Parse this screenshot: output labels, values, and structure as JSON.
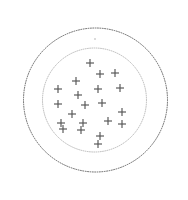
{
  "figure": {
    "title": "",
    "width": 188,
    "height": 200,
    "background_color": "#ffffff"
  },
  "chart_data": {
    "type": "scatter",
    "title": "",
    "subtitle": "",
    "xlabel": "",
    "ylabel": "",
    "xlim": [
      0,
      188
    ],
    "ylim": [
      0,
      200
    ],
    "grid": false,
    "legend": null,
    "axes_visible": false,
    "tick_labels": [],
    "annotations": [],
    "marker_style": "plus-cross",
    "marker_color": "#555555",
    "marker_size": 8,
    "point_count": 21,
    "points": [
      {
        "x": 90,
        "y": 63
      },
      {
        "x": 100,
        "y": 74
      },
      {
        "x": 115,
        "y": 73
      },
      {
        "x": 76,
        "y": 81
      },
      {
        "x": 58,
        "y": 89
      },
      {
        "x": 98,
        "y": 89
      },
      {
        "x": 120,
        "y": 88
      },
      {
        "x": 78,
        "y": 95
      },
      {
        "x": 102,
        "y": 103
      },
      {
        "x": 58,
        "y": 104
      },
      {
        "x": 85,
        "y": 105
      },
      {
        "x": 72,
        "y": 114
      },
      {
        "x": 122,
        "y": 112
      },
      {
        "x": 108,
        "y": 121
      },
      {
        "x": 61,
        "y": 123
      },
      {
        "x": 83,
        "y": 123
      },
      {
        "x": 122,
        "y": 124
      },
      {
        "x": 63,
        "y": 129
      },
      {
        "x": 81,
        "y": 130
      },
      {
        "x": 100,
        "y": 136
      },
      {
        "x": 98,
        "y": 144
      }
    ],
    "stray_points": [
      {
        "x": 95,
        "y": 39,
        "radius": 0.8,
        "color": "#aeaeae"
      }
    ],
    "boundaries": [
      {
        "name": "outer-region",
        "shape": "circle",
        "cx": 95.5,
        "cy": 100,
        "r": 72,
        "line_style": "dotted",
        "color": "#4a4a4a"
      },
      {
        "name": "inner-region",
        "shape": "circle",
        "cx": 94.5,
        "cy": 100,
        "r": 52,
        "line_style": "dotted",
        "color": "#9a9a9a"
      }
    ]
  }
}
